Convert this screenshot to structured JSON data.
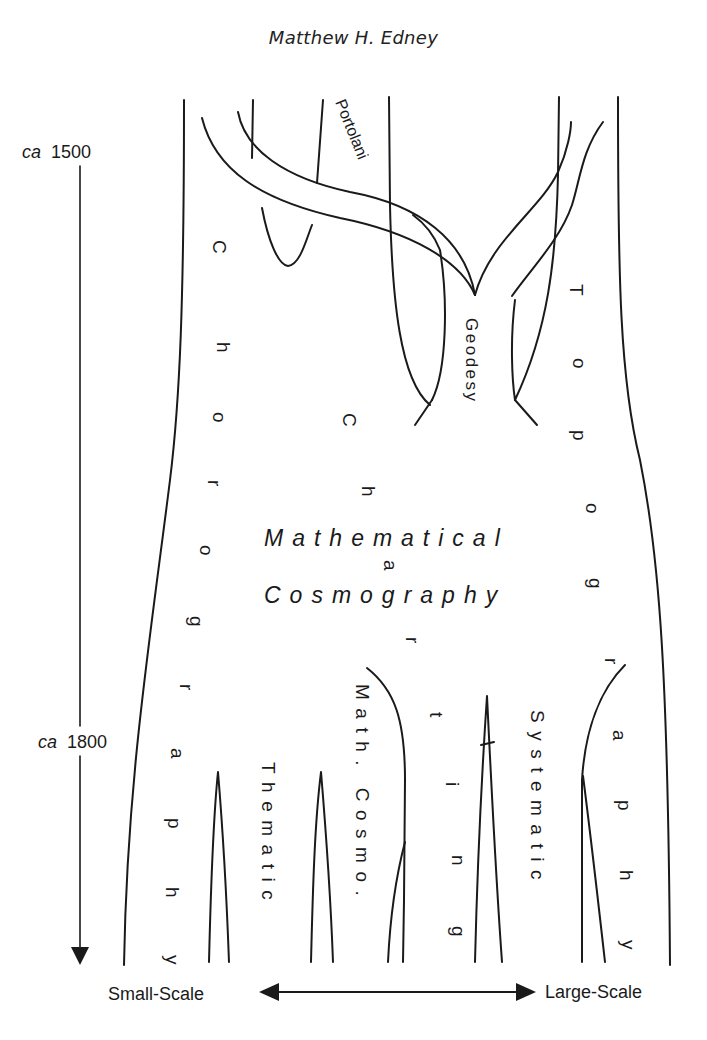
{
  "header": {
    "running_head": "Matthew H. Edney"
  },
  "timeline": {
    "start": {
      "prefix": "ca",
      "year": "1500"
    },
    "end": {
      "prefix": "ca",
      "year": "1800"
    },
    "direction_icon": "arrow-down-icon"
  },
  "scale_axis": {
    "left_label": "Small-Scale",
    "right_label": "Large-Scale",
    "icon": "double-arrow-horizontal-icon"
  },
  "modes": {
    "portolani": "Portolani",
    "geodesy": "Geodesy",
    "chorography_letters": [
      "C",
      "h",
      "o",
      "r",
      "o",
      "g",
      "r",
      "a",
      "p",
      "h",
      "y"
    ],
    "charting_letters": [
      "C",
      "h",
      "a",
      "r",
      "t",
      "i",
      "n",
      "g"
    ],
    "topography_letters": [
      "T",
      "o",
      "p",
      "o",
      "g",
      "r",
      "a",
      "p",
      "h",
      "y"
    ],
    "mathematical_cosmography": {
      "line1": "Mathematical",
      "line2": "Cosmography"
    },
    "thematic": "Thematic",
    "math_cosmo": "Math. Cosmo.",
    "systematic": "Systematic"
  },
  "colors": {
    "ink": "#1a1a1a",
    "paper": "#ffffff"
  }
}
